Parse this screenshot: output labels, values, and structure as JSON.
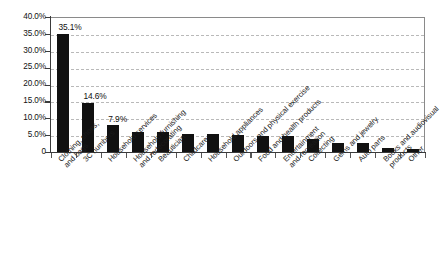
{
  "chart_data": {
    "type": "bar",
    "title": "",
    "subtitle": "",
    "xlabel": "",
    "ylabel": "",
    "ylim": [
      0,
      40
    ],
    "grid": true,
    "legend": null,
    "orientation": "vertical",
    "bar_color": "#111111",
    "y_tick_labels": [
      "40.0%",
      "35.0%",
      "30.0%",
      "25.0%",
      "20.0%",
      "15.0%",
      "10.0%",
      "5.0%",
      "0"
    ],
    "y_tick_values": [
      40,
      35,
      30,
      25,
      20,
      15,
      10,
      5,
      0
    ],
    "categories": [
      "Clothing, shoes,\nand bags",
      "3C numbers",
      "Household services",
      "Household furnishing\nand redecorating",
      "Beautician",
      "Childcare",
      "Household appliances",
      "Outdoors and physical exercise",
      "Food and health products",
      "Entertainment\nand recreation",
      "Collecting",
      "Gems and jewelry",
      "Auto parts",
      "Books and audiovisual\nproducts",
      "Other"
    ],
    "values": [
      35.1,
      14.6,
      7.9,
      5.8,
      5.9,
      5.3,
      5.3,
      5.0,
      4.8,
      4.7,
      3.8,
      2.8,
      2.7,
      1.2,
      0.8
    ],
    "data_labels": [
      "35.1%",
      "14.6%",
      "7.9%",
      "",
      "",
      "",
      "",
      "",
      "",
      "",
      "",
      "",
      "",
      "",
      ""
    ]
  }
}
